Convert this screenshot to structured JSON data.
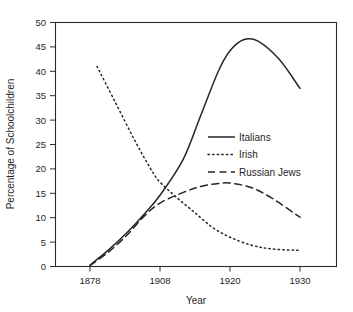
{
  "chart_data": {
    "type": "line",
    "title": "",
    "xlabel": "Year",
    "ylabel": "Percentage of Schoolchildren",
    "xtick_labels": [
      "1878",
      "1908",
      "1920",
      "1930"
    ],
    "ytick_labels": [
      "0",
      "5",
      "10",
      "15",
      "20",
      "25",
      "30",
      "35",
      "40",
      "45",
      "50"
    ],
    "ylim": [
      0,
      50
    ],
    "ytick_step": 5,
    "grid": false,
    "legend_position": "center-right-inside",
    "x_axis_note": "categorical axis, ticks evenly spaced at 1878, 1908, 1920, 1930",
    "series": [
      {
        "name": "Italians",
        "style": "solid",
        "color": "#262626",
        "points": [
          {
            "x": "1878",
            "y": 0.3
          },
          {
            "x": "1886",
            "y": 3.4
          },
          {
            "x": "1894",
            "y": 7.0
          },
          {
            "x": "1901",
            "y": 10.6
          },
          {
            "x": "1908",
            "y": 14.6
          },
          {
            "x": "1912",
            "y": 22.0
          },
          {
            "x": "1915",
            "y": 31.0
          },
          {
            "x": "1918",
            "y": 40.0
          },
          {
            "x": "1920",
            "y": 44.2
          },
          {
            "x": "1922",
            "y": 46.5
          },
          {
            "x": "1924",
            "y": 46.2
          },
          {
            "x": "1927",
            "y": 42.5
          },
          {
            "x": "1930",
            "y": 36.5
          }
        ]
      },
      {
        "name": "Irish",
        "style": "dotted",
        "color": "#262626",
        "points": [
          {
            "x": "1881",
            "y": 41.0
          },
          {
            "x": "1889",
            "y": 33.5
          },
          {
            "x": "1897",
            "y": 26.0
          },
          {
            "x": "1904",
            "y": 20.0
          },
          {
            "x": "1908",
            "y": 17.3
          },
          {
            "x": "1911",
            "y": 14.0
          },
          {
            "x": "1914",
            "y": 11.0
          },
          {
            "x": "1917",
            "y": 8.0
          },
          {
            "x": "1920",
            "y": 6.0
          },
          {
            "x": "1923",
            "y": 4.4
          },
          {
            "x": "1926",
            "y": 3.6
          },
          {
            "x": "1930",
            "y": 3.3
          }
        ]
      },
      {
        "name": "Russian Jews",
        "style": "dashed",
        "color": "#262626",
        "points": [
          {
            "x": "1878",
            "y": 0.2
          },
          {
            "x": "1886",
            "y": 3.0
          },
          {
            "x": "1894",
            "y": 6.5
          },
          {
            "x": "1901",
            "y": 10.2
          },
          {
            "x": "1908",
            "y": 13.0
          },
          {
            "x": "1912",
            "y": 15.2
          },
          {
            "x": "1915",
            "y": 16.4
          },
          {
            "x": "1918",
            "y": 17.0
          },
          {
            "x": "1920",
            "y": 17.1
          },
          {
            "x": "1923",
            "y": 16.2
          },
          {
            "x": "1926",
            "y": 14.0
          },
          {
            "x": "1930",
            "y": 10.1
          }
        ]
      }
    ],
    "legend_entries": [
      {
        "label": "Italians",
        "style": "solid"
      },
      {
        "label": "Irish",
        "style": "dotted"
      },
      {
        "label": "Russian Jews",
        "style": "dashed"
      }
    ]
  }
}
